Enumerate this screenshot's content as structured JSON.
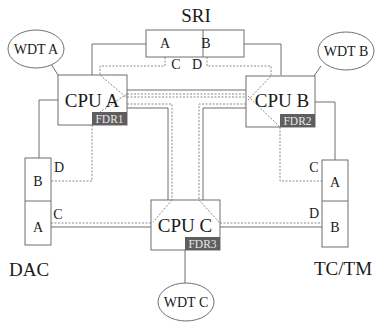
{
  "diagram": {
    "sri": {
      "label": "SRI",
      "port_a": "A",
      "port_b": "B",
      "link_c": "C",
      "link_d": "D"
    },
    "cpus": [
      {
        "label": "CPU A",
        "fdr": "FDR1"
      },
      {
        "label": "CPU B",
        "fdr": "FDR2"
      },
      {
        "label": "CPU C",
        "fdr": "FDR3"
      }
    ],
    "watchdogs": [
      {
        "label": "WDT A"
      },
      {
        "label": "WDT B"
      },
      {
        "label": "WDT C"
      }
    ],
    "dac": {
      "label": "DAC",
      "port_a": "A",
      "port_b": "B",
      "link_c": "C",
      "link_d": "D"
    },
    "tctm": {
      "label": "TC/TM",
      "port_a": "A",
      "port_b": "B",
      "link_c": "C",
      "link_d": "D"
    },
    "legend": {
      "solid_line": "primary link",
      "dashed_line": "redundant link"
    }
  }
}
